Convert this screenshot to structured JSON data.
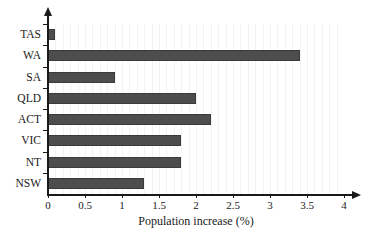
{
  "chart_data": {
    "type": "bar",
    "orientation": "horizontal",
    "title": "",
    "xlabel": "Population increase (%)",
    "ylabel": "",
    "categories": [
      "TAS",
      "WA",
      "SA",
      "QLD",
      "ACT",
      "VIC",
      "NT",
      "NSW"
    ],
    "values": [
      0.1,
      3.4,
      0.9,
      2.0,
      2.2,
      1.8,
      1.8,
      1.3
    ],
    "xlim": [
      0,
      4
    ],
    "xticks": [
      0,
      0.5,
      1,
      1.5,
      2,
      2.5,
      3,
      3.5,
      4
    ],
    "xticklabels": [
      "0",
      "0.5",
      "1",
      "1.5",
      "2",
      "2.5",
      "3",
      "3.5",
      "4"
    ],
    "grid": "vertical-minor-light",
    "legend": "none",
    "bar_color": "#4d4d4d",
    "axis_color": "#1a1a1a",
    "background_color": "#ffffff"
  }
}
